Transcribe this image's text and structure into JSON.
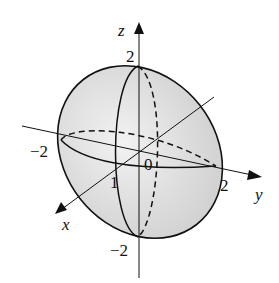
{
  "figure": {
    "axes": {
      "x": {
        "label": "x",
        "tick": "1"
      },
      "y": {
        "label": "y",
        "tick_pos": "2",
        "tick_neg": "−2"
      },
      "z": {
        "label": "z",
        "tick_pos": "2",
        "tick_neg": "−2"
      }
    },
    "origin_label": "0",
    "colors": {
      "fill": "#e6e6e6",
      "stroke": "#111111"
    }
  }
}
